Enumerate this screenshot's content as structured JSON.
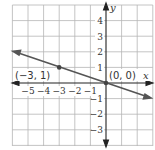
{
  "graph": {
    "x_axis_label": "x",
    "y_axis_label": "y",
    "x_ticks": [
      "−5",
      "−4",
      "−3",
      "−2",
      "−1"
    ],
    "y_ticks": [
      "4",
      "3",
      "2",
      "1",
      "−1",
      "−2",
      "−3"
    ],
    "points": [
      {
        "label": "(−3, 1)",
        "x": -3,
        "y": 1
      },
      {
        "label": "(0, 0)",
        "x": 0,
        "y": 0
      }
    ],
    "line": {
      "slope": "-1/3",
      "intercept": 0,
      "color": "#555555"
    },
    "grid_color": "#b5b5b5",
    "axis_color": "#222222"
  }
}
